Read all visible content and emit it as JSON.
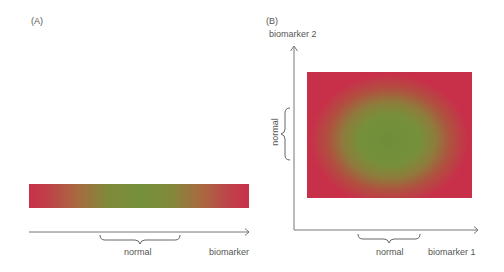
{
  "panels": [
    {
      "id": "A",
      "label": "(A)",
      "x_axis_label": "biomarker",
      "normal_label": "normal",
      "gradient": {
        "edge_color": "#c8304a",
        "center_color": "#76903a"
      }
    },
    {
      "id": "B",
      "label": "(B)",
      "x_axis_label": "biomarker 1",
      "y_axis_label": "biomarker 2",
      "normal_x_label": "normal",
      "normal_y_label": "normal",
      "gradient": {
        "edge_color": "#c8304a",
        "center_color": "#6f8e3a"
      }
    }
  ],
  "colors": {
    "abnormal": "#c8304a",
    "normal": "#76903a",
    "axis": "#666666"
  }
}
